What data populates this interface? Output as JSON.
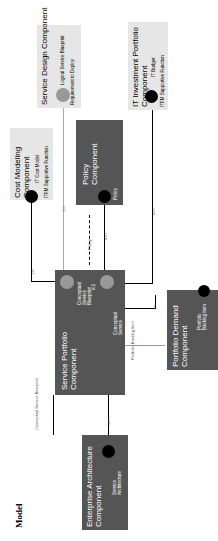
{
  "title": "Model",
  "components": {
    "service_design": {
      "title": "Service Design Component",
      "items": [
        "Logical Service Blueprint",
        "Requirement to Deploy"
      ]
    },
    "it_investment": {
      "title": "IT Investment Portfolio Component",
      "items": [
        "IT Budget",
        "ITFM Supportive Function"
      ]
    },
    "cost_modeling": {
      "title": "Cost Modeling Component",
      "items": [
        "IT Cost Model",
        "ITFM Supportive Function"
      ]
    },
    "policy": {
      "title": "Policy Component",
      "items": [
        "Policy"
      ]
    },
    "service_portfolio": {
      "title": "Service Portfolio Component",
      "items": [
        "Conceptual Service Blueprint",
        "Conceptual Service"
      ]
    },
    "portfolio_demand": {
      "title": "Portfolio Demand Component",
      "items": [
        "Portfolio Backlog Item"
      ]
    },
    "enterprise_architecture": {
      "title": "Enterprise Architecture Component",
      "items": [
        "Service Architecture"
      ]
    }
  },
  "connectors": {
    "cost_to_sp": "1:n",
    "design_to_sp": "1:n",
    "policy_flow": "Policy",
    "policy_card": "n:m",
    "inner": "n:1",
    "invest_card": "n:m",
    "demand_card": "1:n",
    "backlog_flow": "Portfolio Backlog Item",
    "blueprint_flow": "Conceptual Service Blueprint",
    "ea_card": "n:m"
  }
}
